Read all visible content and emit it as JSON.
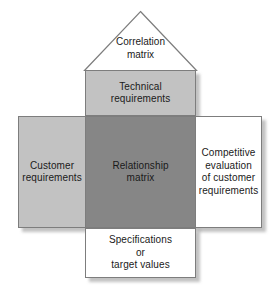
{
  "diagram": {
    "type": "qfd-house-of-quality",
    "width": 279,
    "height": 288,
    "background": "#ffffff",
    "colors": {
      "light_gray_fill": "#c2c2c2",
      "dark_gray_fill": "#868686",
      "white_fill": "#ffffff",
      "outline": "#7d7d7d",
      "text": "#1a1a1a"
    },
    "regions": {
      "roof": {
        "name": "correlation-matrix",
        "label": "Correlation\nmatrix",
        "fill": "#ffffff",
        "shape": "triangle"
      },
      "top": {
        "name": "technical-requirements",
        "label": "Technical\nrequirements",
        "fill": "#c2c2c2",
        "shape": "rectangle"
      },
      "left": {
        "name": "customer-requirements",
        "label": "Customer\nrequirements",
        "fill": "#c2c2c2",
        "shape": "rectangle"
      },
      "center": {
        "name": "relationship-matrix",
        "label": "Relationship\nmatrix",
        "fill": "#868686",
        "shape": "rectangle"
      },
      "right": {
        "name": "competitive-evaluation",
        "label": "Competitive\nevaluation\nof customer\nrequirements",
        "fill": "#ffffff",
        "shape": "rectangle"
      },
      "bottom": {
        "name": "specifications-target-values",
        "label": "Specifications\nor\ntarget values",
        "fill": "#ffffff",
        "shape": "rectangle"
      }
    }
  }
}
